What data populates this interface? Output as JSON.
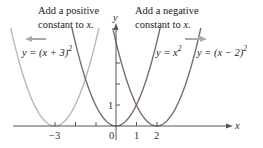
{
  "chart_data": {
    "type": "line",
    "title": "",
    "xlabel": "x",
    "ylabel": "y",
    "x_ticks": [
      -3,
      -2,
      -1,
      0,
      1,
      2
    ],
    "x_tick_labels": [
      "-3",
      "0",
      "1",
      "2"
    ],
    "y_ticks": [
      1,
      2,
      3
    ],
    "y_tick_labels": [
      "1"
    ],
    "grid": false,
    "xlim": [
      -5,
      5.6
    ],
    "ylim": [
      0,
      4.9
    ],
    "series": [
      {
        "name": "y = (x + 3)^2",
        "function": "(x+3)^2",
        "vertex": [
          -3,
          0
        ],
        "color": "#b8b8b8"
      },
      {
        "name": "y = x^2",
        "function": "x^2",
        "vertex": [
          0,
          0
        ],
        "color": "#7a6a75"
      },
      {
        "name": "y = (x - 2)^2",
        "function": "(x-2)^2",
        "vertex": [
          2,
          0
        ],
        "color": "#7a6a75"
      }
    ],
    "annotations": [
      {
        "text": "Add a positive constant to x.",
        "arrow": "left"
      },
      {
        "text": "Add a negative constant to x.",
        "arrow": "right"
      }
    ]
  },
  "labels": {
    "ann_left_line1": "Add a positive",
    "ann_left_line2": "constant to ",
    "ann_left_var": "x.",
    "ann_right_line1": "Add a negative",
    "ann_right_line2": "constant to ",
    "ann_right_var": "x.",
    "curve_left": "y = (x + 3)",
    "curve_mid": "y = x",
    "curve_right": "y = (x − 2)",
    "exp": "2",
    "x_axis": "x",
    "y_axis": "y",
    "tick_neg3": "−3",
    "tick_0": "0",
    "tick_1": "1",
    "tick_2": "2",
    "ytick_1": "1"
  }
}
